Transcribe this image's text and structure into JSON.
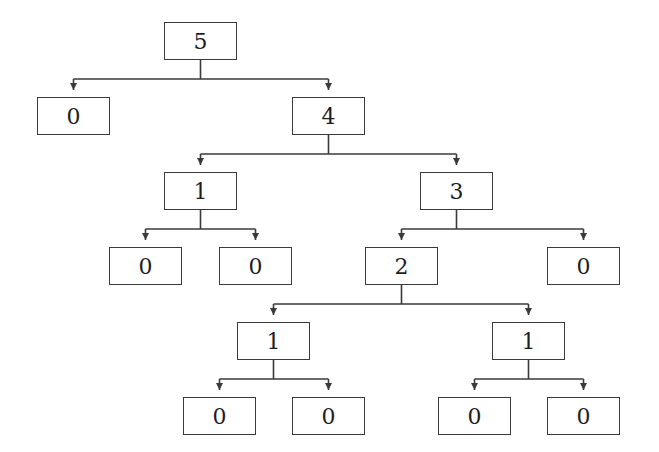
{
  "diagram": {
    "type": "tree",
    "colors": {
      "stroke": "#3a3a3a",
      "text": "#1e1e1e",
      "background": "#ffffff"
    },
    "node_size": {
      "w": 73,
      "h": 38
    },
    "nodes": [
      {
        "id": "n5",
        "label": "5",
        "x": 164,
        "y": 22
      },
      {
        "id": "n0a",
        "label": "0",
        "x": 37,
        "y": 97
      },
      {
        "id": "n4",
        "label": "4",
        "x": 292,
        "y": 97
      },
      {
        "id": "n1a",
        "label": "1",
        "x": 164,
        "y": 172
      },
      {
        "id": "n3",
        "label": "3",
        "x": 420,
        "y": 172
      },
      {
        "id": "n0b",
        "label": "0",
        "x": 109,
        "y": 247
      },
      {
        "id": "n0c",
        "label": "0",
        "x": 219,
        "y": 247
      },
      {
        "id": "n2",
        "label": "2",
        "x": 365,
        "y": 247
      },
      {
        "id": "n0d",
        "label": "0",
        "x": 547,
        "y": 247
      },
      {
        "id": "n1b",
        "label": "1",
        "x": 237,
        "y": 322
      },
      {
        "id": "n1c",
        "label": "1",
        "x": 492,
        "y": 322
      },
      {
        "id": "n0e",
        "label": "0",
        "x": 183,
        "y": 397
      },
      {
        "id": "n0f",
        "label": "0",
        "x": 292,
        "y": 397
      },
      {
        "id": "n0g",
        "label": "0",
        "x": 438,
        "y": 397
      },
      {
        "id": "n0h",
        "label": "0",
        "x": 547,
        "y": 397
      }
    ],
    "edges": [
      {
        "from": "n5",
        "children": [
          "n0a",
          "n4"
        ]
      },
      {
        "from": "n4",
        "children": [
          "n1a",
          "n3"
        ]
      },
      {
        "from": "n1a",
        "children": [
          "n0b",
          "n0c"
        ]
      },
      {
        "from": "n3",
        "children": [
          "n2",
          "n0d"
        ]
      },
      {
        "from": "n2",
        "children": [
          "n1b",
          "n1c"
        ]
      },
      {
        "from": "n1b",
        "children": [
          "n0e",
          "n0f"
        ]
      },
      {
        "from": "n1c",
        "children": [
          "n0g",
          "n0h"
        ]
      }
    ]
  }
}
